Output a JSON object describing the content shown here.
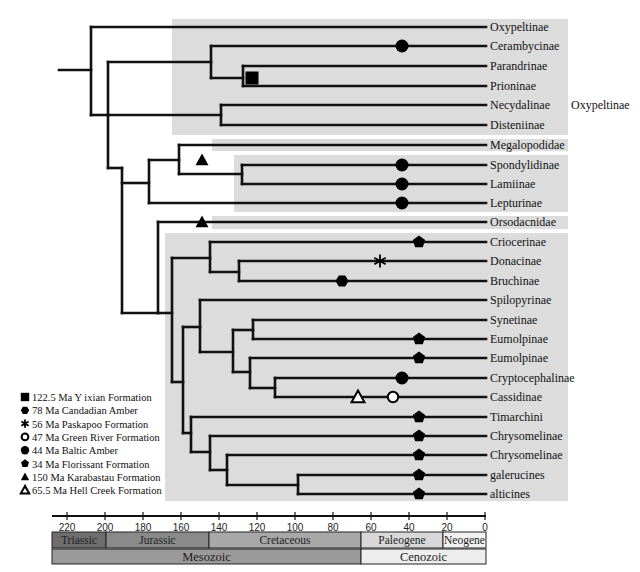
{
  "figure": {
    "title_cropped": "",
    "time_axis": {
      "ticks": [
        220,
        200,
        180,
        160,
        140,
        120,
        100,
        80,
        60,
        40,
        20,
        0
      ],
      "unit": "Ma",
      "x_at_0": 485,
      "px_per_ma": 1.9
    },
    "periods": [
      {
        "label": "Triassic",
        "from": 252,
        "to": 201,
        "color": "#6e6e6e"
      },
      {
        "label": "Jurassic",
        "from": 201,
        "to": 145,
        "color": "#8a8a8a"
      },
      {
        "label": "Cretaceous",
        "from": 145,
        "to": 66,
        "color": "#a8a8a8"
      },
      {
        "label": "Paleogene",
        "from": 66,
        "to": 23,
        "color": "#d8d8d8"
      },
      {
        "label": "Neogene",
        "from": 23,
        "to": 0,
        "color": "#f2f2f2"
      }
    ],
    "eras": [
      {
        "label": "Mesozoic",
        "from": 252,
        "to": 66,
        "color": "#9a9a9a"
      },
      {
        "label": "Cenozoic",
        "from": 66,
        "to": 0,
        "color": "#eeeeee"
      }
    ],
    "group_label": "Oxypeltinae",
    "taxa": [
      {
        "name": "Oxypeltinae",
        "y": 27
      },
      {
        "name": "Cerambycinae",
        "y": 46
      },
      {
        "name": "Parandrinae",
        "y": 66
      },
      {
        "name": "Prioninae",
        "y": 86
      },
      {
        "name": "Necydalinae",
        "y": 105
      },
      {
        "name": "Disteniinae",
        "y": 125
      },
      {
        "name": "Megalopodidae",
        "y": 145
      },
      {
        "name": "Spondylidinae",
        "y": 165
      },
      {
        "name": "Lamiinae",
        "y": 184
      },
      {
        "name": "Lepturinae",
        "y": 203
      },
      {
        "name": "Orsodacnidae",
        "y": 222
      },
      {
        "name": "Criocerinae",
        "y": 242
      },
      {
        "name": "Donacinae",
        "y": 261
      },
      {
        "name": "Bruchinae",
        "y": 281
      },
      {
        "name": "Spilopyrinae",
        "y": 300
      },
      {
        "name": "Synetinae",
        "y": 320
      },
      {
        "name": "Eumolpinae",
        "y": 339
      },
      {
        "name": "Eumolpinae",
        "y": 358
      },
      {
        "name": "Cryptocephalinae",
        "y": 378
      },
      {
        "name": "Cassidinae",
        "y": 397
      },
      {
        "name": "Timarchini",
        "y": 417
      },
      {
        "name": "Chrysomelinae",
        "y": 436
      },
      {
        "name": "Chrysomelinae",
        "y": 455
      },
      {
        "name": "galerucines",
        "y": 475
      },
      {
        "name": "alticines",
        "y": 494
      }
    ],
    "fossils": [
      {
        "symbol": "square",
        "x": 252,
        "y": 78
      },
      {
        "symbol": "circle",
        "x": 402,
        "y": 46
      },
      {
        "symbol": "circle",
        "x": 402,
        "y": 165
      },
      {
        "symbol": "circle",
        "x": 402,
        "y": 184
      },
      {
        "symbol": "circle",
        "x": 402,
        "y": 203
      },
      {
        "symbol": "triangle",
        "x": 202,
        "y": 160
      },
      {
        "symbol": "triangle",
        "x": 202,
        "y": 222
      },
      {
        "symbol": "pentagon",
        "x": 419,
        "y": 242
      },
      {
        "symbol": "asterisk",
        "x": 380,
        "y": 261
      },
      {
        "symbol": "hexagon",
        "x": 342,
        "y": 281
      },
      {
        "symbol": "pentagon",
        "x": 419,
        "y": 339
      },
      {
        "symbol": "pentagon",
        "x": 419,
        "y": 358
      },
      {
        "symbol": "circle",
        "x": 402,
        "y": 378
      },
      {
        "symbol": "triangle-open",
        "x": 358,
        "y": 397
      },
      {
        "symbol": "circle-open",
        "x": 393,
        "y": 397
      },
      {
        "symbol": "pentagon",
        "x": 419,
        "y": 417
      },
      {
        "symbol": "pentagon",
        "x": 419,
        "y": 436
      },
      {
        "symbol": "pentagon",
        "x": 419,
        "y": 455
      },
      {
        "symbol": "pentagon",
        "x": 419,
        "y": 475
      },
      {
        "symbol": "pentagon",
        "x": 419,
        "y": 494
      }
    ],
    "legend": [
      {
        "symbol": "square",
        "label": "122.5 Ma Y ixian Formation"
      },
      {
        "symbol": "hexagon",
        "label": "78 Ma Candadian Amber"
      },
      {
        "symbol": "asterisk",
        "label": "56 Ma Paskapoo Formation"
      },
      {
        "symbol": "circle-open",
        "label": "47 Ma Green River Formation"
      },
      {
        "symbol": "circle",
        "label": "44 Ma Baltic Amber"
      },
      {
        "symbol": "pentagon",
        "label": "34 Ma Florissant Formation"
      },
      {
        "symbol": "triangle",
        "label": "150 Ma Karabastau Formation"
      },
      {
        "symbol": "triangle-open",
        "label": "65.5 Ma Hell Creek Formation"
      }
    ],
    "shaded_boxes": [
      {
        "x": 172,
        "y": 19,
        "w": 396,
        "h": 116
      },
      {
        "x": 212,
        "y": 139,
        "w": 356,
        "h": 12
      },
      {
        "x": 234,
        "y": 155,
        "w": 334,
        "h": 57
      },
      {
        "x": 212,
        "y": 216,
        "w": 356,
        "h": 13
      },
      {
        "x": 165,
        "y": 233,
        "w": 403,
        "h": 268
      }
    ],
    "branches": [
      [
        59,
        70,
        91,
        70
      ],
      [
        91,
        27,
        91,
        115
      ],
      [
        91,
        27,
        486,
        27
      ],
      [
        91,
        115,
        108,
        115
      ],
      [
        108,
        62,
        108,
        168
      ],
      [
        108,
        62,
        211,
        62
      ],
      [
        211,
        46,
        211,
        78
      ],
      [
        211,
        46,
        486,
        46
      ],
      [
        211,
        78,
        243,
        78
      ],
      [
        243,
        66,
        243,
        86
      ],
      [
        243,
        66,
        486,
        66
      ],
      [
        243,
        86,
        486,
        86
      ],
      [
        108,
        115,
        221,
        115
      ],
      [
        221,
        105,
        221,
        125
      ],
      [
        221,
        105,
        486,
        105
      ],
      [
        221,
        125,
        486,
        125
      ],
      [
        108,
        168,
        122,
        168
      ],
      [
        122,
        168,
        122,
        313
      ],
      [
        122,
        183,
        149,
        183
      ],
      [
        149,
        160,
        149,
        203
      ],
      [
        149,
        160,
        179,
        160
      ],
      [
        179,
        145,
        179,
        174
      ],
      [
        179,
        145,
        486,
        145
      ],
      [
        179,
        174,
        242,
        174
      ],
      [
        242,
        165,
        242,
        184
      ],
      [
        242,
        165,
        486,
        165
      ],
      [
        242,
        184,
        486,
        184
      ],
      [
        149,
        203,
        486,
        203
      ],
      [
        122,
        313,
        158,
        313
      ],
      [
        158,
        222,
        158,
        313
      ],
      [
        158,
        222,
        486,
        222
      ],
      [
        158,
        313,
        172,
        313
      ],
      [
        172,
        258,
        172,
        382
      ],
      [
        172,
        258,
        210,
        258
      ],
      [
        210,
        242,
        210,
        272
      ],
      [
        210,
        242,
        486,
        242
      ],
      [
        210,
        272,
        239,
        272
      ],
      [
        239,
        261,
        239,
        281
      ],
      [
        239,
        261,
        486,
        261
      ],
      [
        239,
        281,
        486,
        281
      ],
      [
        172,
        382,
        183,
        382
      ],
      [
        183,
        327,
        183,
        433
      ],
      [
        183,
        327,
        200,
        327
      ],
      [
        200,
        300,
        200,
        352
      ],
      [
        200,
        300,
        486,
        300
      ],
      [
        200,
        352,
        233,
        352
      ],
      [
        233,
        330,
        233,
        372
      ],
      [
        233,
        330,
        253,
        330
      ],
      [
        253,
        320,
        253,
        339
      ],
      [
        253,
        320,
        486,
        320
      ],
      [
        253,
        339,
        486,
        339
      ],
      [
        233,
        372,
        250,
        372
      ],
      [
        250,
        358,
        250,
        388
      ],
      [
        250,
        358,
        486,
        358
      ],
      [
        250,
        388,
        275,
        388
      ],
      [
        275,
        378,
        275,
        397
      ],
      [
        275,
        378,
        486,
        378
      ],
      [
        275,
        397,
        486,
        397
      ],
      [
        183,
        433,
        191,
        433
      ],
      [
        191,
        417,
        191,
        452
      ],
      [
        191,
        417,
        486,
        417
      ],
      [
        191,
        452,
        210,
        452
      ],
      [
        210,
        436,
        210,
        470
      ],
      [
        210,
        436,
        486,
        436
      ],
      [
        210,
        470,
        227,
        470
      ],
      [
        227,
        455,
        227,
        485
      ],
      [
        227,
        455,
        486,
        455
      ],
      [
        227,
        485,
        298,
        485
      ],
      [
        298,
        475,
        298,
        494
      ],
      [
        298,
        475,
        486,
        475
      ],
      [
        298,
        494,
        486,
        494
      ]
    ]
  }
}
